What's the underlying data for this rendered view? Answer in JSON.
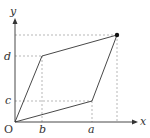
{
  "diagram": {
    "type": "parallelogram-on-axes",
    "axes": {
      "x_label": "x",
      "y_label": "y",
      "origin_label": "O"
    },
    "tick_labels": {
      "x": [
        "b",
        "a"
      ],
      "y": [
        "c",
        "d"
      ]
    },
    "points": [
      {
        "name": "O",
        "coords": "(0, 0)"
      },
      {
        "name": "A",
        "coords": "(a, c)"
      },
      {
        "name": "B",
        "coords": "(b, d)"
      },
      {
        "name": "C",
        "coords": "(a+b, c+d)",
        "marked": true
      }
    ],
    "colors": {
      "line": "#333333",
      "dashed": "#999999",
      "point": "#111111"
    }
  }
}
